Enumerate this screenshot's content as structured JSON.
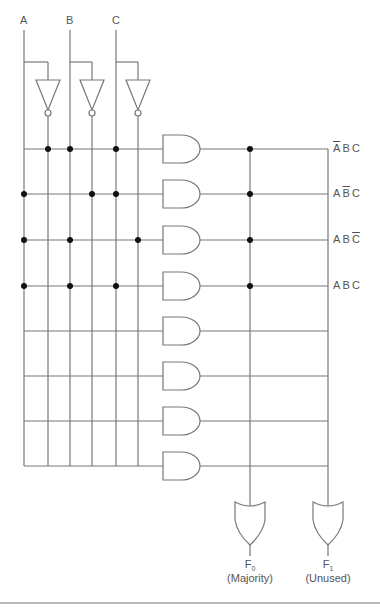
{
  "diagram": {
    "inputs": [
      {
        "label": "A",
        "x": 24
      },
      {
        "label": "B",
        "x": 70
      },
      {
        "label": "C",
        "x": 116
      }
    ],
    "inverted_lines_x": [
      48,
      92,
      138
    ],
    "minterm_rows_y": [
      149,
      194,
      240,
      286,
      331,
      376,
      421,
      466
    ],
    "minterm_labels": [
      {
        "parts": [
          {
            "t": "A",
            "bar": true
          },
          {
            "t": "B",
            "bar": false
          },
          {
            "t": "C",
            "bar": false
          }
        ]
      },
      {
        "parts": [
          {
            "t": "A",
            "bar": false
          },
          {
            "t": "B",
            "bar": true
          },
          {
            "t": "C",
            "bar": false
          }
        ]
      },
      {
        "parts": [
          {
            "t": "A",
            "bar": false
          },
          {
            "t": "B",
            "bar": false
          },
          {
            "t": "C",
            "bar": true
          }
        ]
      },
      {
        "parts": [
          {
            "t": "A",
            "bar": false
          },
          {
            "t": "B",
            "bar": false
          },
          {
            "t": "C",
            "bar": false
          }
        ]
      }
    ],
    "and_connections": [
      [
        48,
        70,
        116
      ],
      [
        24,
        92,
        116
      ],
      [
        24,
        70,
        138
      ],
      [
        24,
        70,
        116
      ],
      [],
      [],
      [],
      []
    ],
    "or_column_x": [
      250,
      328
    ],
    "or_connections_rows": [
      [
        0,
        1,
        2,
        3
      ],
      []
    ],
    "outputs": [
      {
        "name": "F",
        "sub": "0",
        "desc": "(Majority)"
      },
      {
        "name": "F",
        "sub": "1",
        "desc": "(Unused)"
      }
    ],
    "line_color": "#777777",
    "dot_color": "#111111"
  }
}
